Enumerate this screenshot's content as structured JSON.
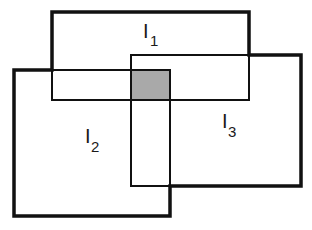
{
  "diagram": {
    "colors": {
      "background": "#ffffff",
      "stroke": "#111111",
      "shaded_intersection": "#a9a9a9"
    },
    "rectangles": [
      {
        "id": "I1",
        "label_main": "I",
        "label_sub": "1",
        "x": 52,
        "y": 12,
        "width": 197,
        "height": 88
      },
      {
        "id": "I2",
        "label_main": "I",
        "label_sub": "2",
        "x": 14,
        "y": 70,
        "width": 156,
        "height": 146
      },
      {
        "id": "I3",
        "label_main": "I",
        "label_sub": "3",
        "x": 131,
        "y": 55,
        "width": 170,
        "height": 131
      }
    ],
    "intersection": {
      "label": "I1 ∩ I2 ∩ I3",
      "x": 131,
      "y": 70,
      "width": 39,
      "height": 30
    },
    "labels": {
      "i1": {
        "main": "I",
        "sub": "1"
      },
      "i2": {
        "main": "I",
        "sub": "2"
      },
      "i3": {
        "main": "I",
        "sub": "3"
      }
    }
  }
}
